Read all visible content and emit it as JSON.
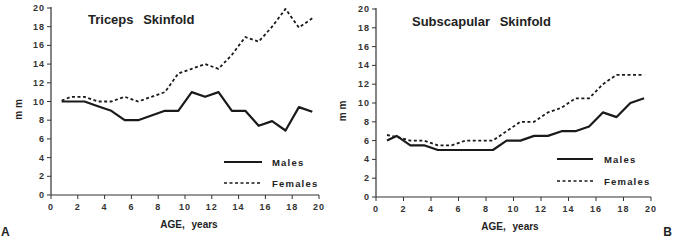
{
  "chart_data": [
    {
      "type": "line",
      "panel_label": "A",
      "title": "Triceps Skinfold",
      "xlabel": "AGE, years",
      "ylabel": "m m",
      "xlim": [
        0,
        20
      ],
      "ylim": [
        0,
        20
      ],
      "xticks": [
        0,
        2,
        4,
        6,
        8,
        10,
        12,
        14,
        16,
        18,
        20
      ],
      "yticks": [
        0,
        2,
        4,
        6,
        8,
        10,
        12,
        14,
        16,
        18,
        20
      ],
      "grid": false,
      "legend_position": "lower right",
      "x": [
        0.8,
        1.5,
        2.5,
        3.5,
        4.5,
        5.5,
        6.5,
        7.5,
        8.5,
        9.5,
        10.5,
        11.5,
        12.5,
        13.5,
        14.5,
        15.5,
        16.5,
        17.5,
        18.5,
        19.5
      ],
      "series": [
        {
          "name": "Males",
          "style": "solid",
          "values": [
            10.0,
            10.0,
            10.0,
            9.5,
            9.0,
            8.0,
            8.0,
            8.5,
            9.0,
            9.0,
            11.0,
            10.5,
            11.0,
            9.0,
            9.0,
            7.4,
            7.9,
            6.9,
            9.4,
            8.9
          ]
        },
        {
          "name": "Females",
          "style": "dashed",
          "values": [
            10.1,
            10.5,
            10.5,
            10.0,
            10.0,
            10.5,
            10.0,
            10.5,
            11.0,
            13.0,
            13.5,
            14.0,
            13.5,
            15.0,
            16.9,
            16.4,
            18.0,
            19.9,
            17.9,
            18.9
          ]
        }
      ]
    },
    {
      "type": "line",
      "panel_label": "B",
      "title": "Subscapular Skinfold",
      "xlabel": "AGE, years",
      "ylabel": "m m",
      "xlim": [
        0,
        20
      ],
      "ylim": [
        0,
        20
      ],
      "xticks": [
        0,
        2,
        4,
        6,
        8,
        10,
        12,
        14,
        16,
        18,
        20
      ],
      "yticks": [
        0,
        2,
        4,
        6,
        8,
        10,
        12,
        14,
        16,
        18,
        20
      ],
      "grid": false,
      "legend_position": "lower right",
      "x": [
        0.8,
        1.5,
        2.5,
        3.5,
        4.5,
        5.5,
        6.5,
        7.5,
        8.5,
        9.5,
        10.5,
        11.5,
        12.5,
        13.5,
        14.5,
        15.5,
        16.5,
        17.5,
        18.5,
        19.5
      ],
      "series": [
        {
          "name": "Males",
          "style": "solid",
          "values": [
            6.0,
            6.5,
            5.5,
            5.5,
            5.0,
            5.0,
            5.0,
            5.0,
            5.0,
            6.0,
            6.0,
            6.5,
            6.5,
            7.0,
            7.0,
            7.5,
            9.0,
            8.5,
            10.0,
            10.5
          ]
        },
        {
          "name": "Females",
          "style": "dashed",
          "values": [
            6.6,
            6.4,
            6.0,
            6.0,
            5.5,
            5.5,
            6.0,
            6.0,
            6.0,
            7.0,
            8.0,
            8.0,
            9.0,
            9.5,
            10.5,
            10.5,
            12.0,
            13.0,
            13.0,
            13.0
          ]
        }
      ]
    }
  ],
  "charts": [
    {
      "title": "Triceps  Skinfold",
      "xlabel": "AGE,  years",
      "ylabel": "m m",
      "panel": "A",
      "legend": {
        "males": "Males",
        "females": "Females"
      }
    },
    {
      "title": "Subscapular  Skinfold",
      "xlabel": "AGE,  years",
      "ylabel": "m m",
      "panel": "B",
      "legend": {
        "males": "Males",
        "females": "Females"
      }
    }
  ]
}
